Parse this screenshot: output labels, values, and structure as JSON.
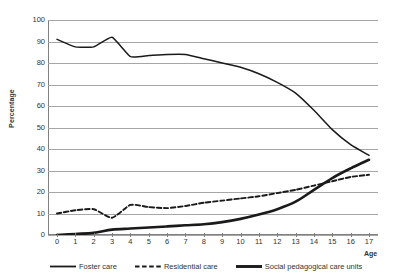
{
  "chart_data": {
    "type": "line",
    "title": "",
    "xlabel": "Age",
    "ylabel": "Percentage",
    "xlim": [
      0,
      17
    ],
    "ylim": [
      0,
      100
    ],
    "ytick_step": 10,
    "grid": true,
    "legend_position": "bottom",
    "x": [
      0,
      1,
      2,
      3,
      4,
      5,
      6,
      7,
      8,
      9,
      10,
      11,
      12,
      13,
      14,
      15,
      16,
      17
    ],
    "xtick_labels": [
      "0",
      "1",
      "2",
      "3",
      "4",
      "5",
      "6",
      "7",
      "8",
      "9",
      "10",
      "11",
      "12",
      "13",
      "14",
      "15",
      "16",
      "17"
    ],
    "ytick_labels": [
      "0",
      "10",
      "20",
      "30",
      "40",
      "50",
      "60",
      "70",
      "80",
      "90",
      "100"
    ],
    "series": [
      {
        "name": "Foster care",
        "style": "solid-thin",
        "color": "#1a1a1a",
        "values": [
          91,
          87.5,
          87.5,
          92,
          83,
          83.5,
          84,
          84,
          82,
          80,
          78,
          75,
          71,
          66,
          58,
          49,
          42,
          37
        ]
      },
      {
        "name": "Residential care",
        "style": "dashed",
        "color": "#1a1a1a",
        "values": [
          10,
          11.5,
          12,
          8,
          14,
          13,
          12.5,
          13.5,
          15,
          16,
          17,
          18,
          19.5,
          21,
          23,
          25,
          27,
          28
        ]
      },
      {
        "name": "Social pedagogical care units",
        "style": "solid-thick",
        "color": "#1a1a1a",
        "values": [
          0,
          0.5,
          1,
          2.5,
          3,
          3.5,
          4,
          4.5,
          5,
          6,
          7.5,
          9.5,
          12,
          15.5,
          21,
          26.5,
          31,
          35
        ]
      }
    ]
  },
  "axes": {
    "y_title": "Percentage",
    "x_title": "Age"
  },
  "colors": {
    "line": "#1a1a1a",
    "grid": "#a6a6a6",
    "axis": "#808080",
    "text": "#333333",
    "background": "#ffffff"
  }
}
